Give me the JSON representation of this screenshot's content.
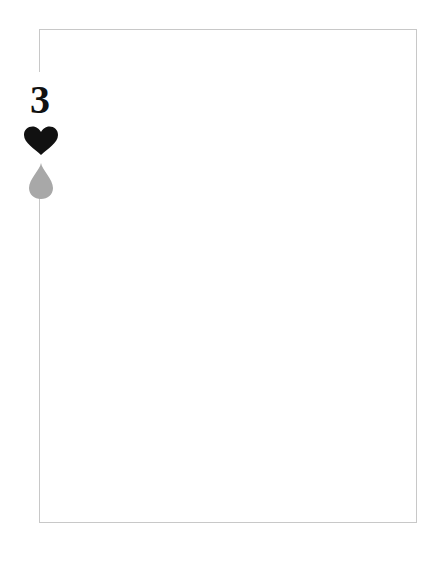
{
  "card": {
    "rank": "3",
    "suit_icon": "heart-icon",
    "secondary_icon": "drop-icon",
    "colors": {
      "border": "#c8c8c8",
      "rank": "#111111",
      "heart": "#111111",
      "drop": "#a8a8a8",
      "background": "#ffffff"
    }
  }
}
